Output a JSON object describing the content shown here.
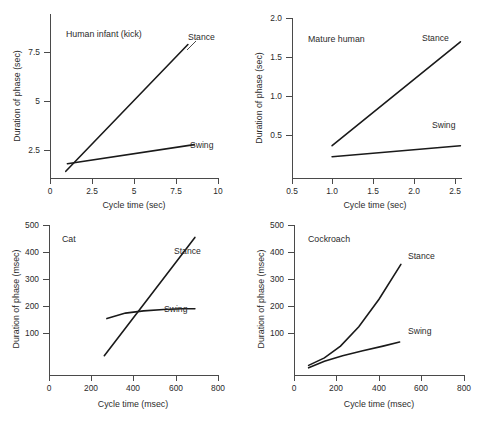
{
  "figure": {
    "name": "duration-of-phase-vs-cycle-time",
    "panel_count": 4
  },
  "chart_data": [
    {
      "type": "line",
      "title": "Human infant (kick)",
      "xlabel": "Cycle time (sec)",
      "ylabel": "Duration of phase (sec)",
      "xlim": [
        0,
        10.6
      ],
      "ylim": [
        0,
        8.6
      ],
      "xticks": [
        0,
        2.5,
        5,
        7.5,
        10
      ],
      "xticklabels": [
        "0",
        "2.5",
        "5",
        "7.5",
        "10"
      ],
      "yticks": [
        2.5,
        5,
        7.5
      ],
      "yticklabels": [
        "2.5",
        "5",
        "7.5"
      ],
      "grid": false,
      "legend": "inline-annotations",
      "series": [
        {
          "name": "Stance",
          "x": [
            1.0,
            8.7
          ],
          "y": [
            0.35,
            7.0
          ]
        },
        {
          "name": "Swing",
          "x": [
            1.1,
            9.1
          ],
          "y": [
            0.75,
            1.75
          ]
        }
      ]
    },
    {
      "type": "line",
      "title": "Mature human",
      "xlabel": "Cycle time (sec)",
      "ylabel": "Duration of phase (sec)",
      "xlim": [
        0.5,
        2.62
      ],
      "ylim": [
        0.12,
        2.0
      ],
      "xticks": [
        0.5,
        1.0,
        1.5,
        2.0,
        2.5
      ],
      "xticklabels": [
        "0.5",
        "1.0",
        "1.5",
        "2.0",
        "2.5"
      ],
      "yticks": [
        0.5,
        1.0,
        1.5,
        2.0
      ],
      "yticklabels": [
        "0.5",
        "1.0",
        "1.5",
        "2.0"
      ],
      "grid": false,
      "legend": "inline-annotations",
      "series": [
        {
          "name": "Stance",
          "x": [
            1.0,
            2.6
          ],
          "y": [
            0.5,
            1.72
          ]
        },
        {
          "name": "Swing",
          "x": [
            1.0,
            2.6
          ],
          "y": [
            0.37,
            0.5
          ]
        }
      ]
    },
    {
      "type": "line",
      "title": "Cat",
      "xlabel": "Cycle time (msec)",
      "ylabel": "Duration of phase (msec)",
      "xlim": [
        0,
        840
      ],
      "ylim": [
        0,
        545
      ],
      "xticks": [
        0,
        200,
        400,
        600,
        800
      ],
      "xticklabels": [
        "0",
        "200",
        "400",
        "600",
        "800"
      ],
      "yticks": [
        100,
        200,
        300,
        400,
        500
      ],
      "yticklabels": [
        "100",
        "200",
        "300",
        "400",
        "500"
      ],
      "grid": false,
      "legend": "inline-annotations",
      "series": [
        {
          "name": "Stance",
          "x": [
            275,
            725
          ],
          "y": [
            70,
            500
          ]
        },
        {
          "name": "Swing",
          "x": [
            288,
            380,
            470,
            570,
            660,
            725
          ],
          "y": [
            205,
            225,
            233,
            238,
            241,
            241
          ]
        }
      ]
    },
    {
      "type": "line",
      "title": "Cockroach",
      "xlabel": "Cycle time (msec)",
      "ylabel": "Duration of phase (msec)",
      "xlim": [
        0,
        840
      ],
      "ylim": [
        0,
        545
      ],
      "xticks": [
        0,
        200,
        400,
        600,
        800
      ],
      "xticklabels": [
        "0",
        "200",
        "400",
        "600",
        "800"
      ],
      "yticks": [
        100,
        200,
        300,
        400,
        500
      ],
      "yticklabels": [
        "100",
        "200",
        "300",
        "400",
        "500"
      ],
      "grid": false,
      "legend": "inline-annotations",
      "series": [
        {
          "name": "Stance",
          "x": [
            72,
            150,
            230,
            320,
            420,
            528
          ],
          "y": [
            35,
            62,
            105,
            175,
            275,
            402
          ]
        },
        {
          "name": "Swing",
          "x": [
            72,
            150,
            240,
            340,
            440,
            522
          ],
          "y": [
            26,
            50,
            70,
            88,
            105,
            120
          ]
        }
      ]
    }
  ],
  "panels": [
    {
      "id": "human-infant",
      "title": "Human infant (kick)",
      "xlabel": "Cycle time (sec)",
      "ylabel": "Duration of phase (sec)",
      "xticklabels": [
        "0",
        "2.5",
        "5",
        "7.5",
        "10"
      ],
      "yticklabels": [
        "2.5",
        "5",
        "7.5"
      ],
      "stance_label": "Stance",
      "swing_label": "Swing"
    },
    {
      "id": "mature-human",
      "title": "Mature human",
      "xlabel": "Cycle time (sec)",
      "ylabel": "Duration of phase (sec)",
      "xticklabels": [
        "0.5",
        "1.0",
        "1.5",
        "2.0",
        "2.5"
      ],
      "yticklabels": [
        "0.5",
        "1.0",
        "1.5",
        "2.0"
      ],
      "stance_label": "Stance",
      "swing_label": "Swing"
    },
    {
      "id": "cat",
      "title": "Cat",
      "xlabel": "Cycle time (msec)",
      "ylabel": "Duration of phase (msec)",
      "xticklabels": [
        "0",
        "200",
        "400",
        "600",
        "800"
      ],
      "yticklabels": [
        "100",
        "200",
        "300",
        "400",
        "500"
      ],
      "stance_label": "Stance",
      "swing_label": "Swing"
    },
    {
      "id": "cockroach",
      "title": "Cockroach",
      "xlabel": "Cycle time (msec)",
      "ylabel": "Duration of phase (msec)",
      "xticklabels": [
        "0",
        "200",
        "400",
        "600",
        "800"
      ],
      "yticklabels": [
        "100",
        "200",
        "300",
        "400",
        "500"
      ],
      "stance_label": "Stance",
      "swing_label": "Swing"
    }
  ],
  "colors": {
    "curve": "#1a1a1a",
    "axis": "#4a4a4a",
    "text": "#2b2b2b",
    "background": "#ffffff"
  }
}
